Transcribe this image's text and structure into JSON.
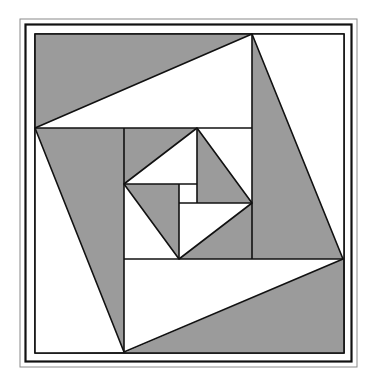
{
  "diagram": {
    "title": "",
    "colors": {
      "background": "#ffffff",
      "fill_gray": "#9b9b9b",
      "fill_white": "#ffffff",
      "stroke": "#111111",
      "outer_frame": "#8a8a8a"
    },
    "frames": {
      "outer_thin": {
        "x": 20,
        "y": 19,
        "w": 337,
        "h": 348
      },
      "middle_thick": {
        "x": 25,
        "y": 24,
        "w": 326,
        "h": 337
      },
      "inner": {
        "x": 35,
        "y": 34,
        "w": 309,
        "h": 319
      }
    },
    "outer_level": {
      "square": [
        [
          35,
          34
        ],
        [
          344,
          34
        ],
        [
          344,
          353
        ],
        [
          35,
          353
        ]
      ],
      "rotated_square": [
        [
          252,
          34
        ],
        [
          343,
          259
        ],
        [
          124,
          352
        ],
        [
          35,
          128
        ]
      ],
      "inner_box": [
        [
          124,
          128
        ],
        [
          252,
          128
        ],
        [
          252,
          259
        ],
        [
          124,
          259
        ]
      ]
    },
    "inner_level": {
      "rotated_square": [
        [
          197,
          128
        ],
        [
          252,
          203
        ],
        [
          179,
          259
        ],
        [
          124,
          184
        ]
      ],
      "center_box": [
        [
          179,
          184
        ],
        [
          197,
          184
        ],
        [
          197,
          203
        ],
        [
          179,
          203
        ]
      ]
    }
  }
}
